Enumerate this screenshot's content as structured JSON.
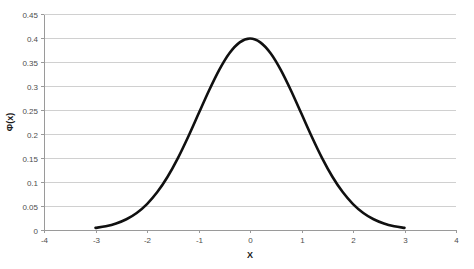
{
  "chart_data": {
    "type": "line",
    "title": "",
    "subtitle": "",
    "xlabel": "X",
    "ylabel": "Φ(x)",
    "xlim": [
      -4,
      4
    ],
    "ylim": [
      0,
      0.45
    ],
    "grid": "horizontal",
    "legend": "none",
    "x_ticks": [
      "-4",
      "-3",
      "-2",
      "-1",
      "0",
      "1",
      "2",
      "3",
      "4"
    ],
    "x_tick_values": [
      -4,
      -3,
      -2,
      -1,
      0,
      1,
      2,
      3,
      4
    ],
    "y_ticks": [
      "0",
      "0.05",
      "0.1",
      "0.15",
      "0.2",
      "0.25",
      "0.3",
      "0.35",
      "0.4",
      "0.45"
    ],
    "y_tick_values": [
      0,
      0.05,
      0.1,
      0.15,
      0.2,
      0.25,
      0.3,
      0.35,
      0.4,
      0.45
    ],
    "series": [
      {
        "name": "standard-normal-pdf",
        "color": "#101010",
        "x": [
          -3.0,
          -2.8,
          -2.6,
          -2.4,
          -2.2,
          -2.0,
          -1.8,
          -1.6,
          -1.4,
          -1.2,
          -1.0,
          -0.8,
          -0.6,
          -0.4,
          -0.2,
          0.0,
          0.2,
          0.4,
          0.6,
          0.8,
          1.0,
          1.2,
          1.4,
          1.6,
          1.8,
          2.0,
          2.2,
          2.4,
          2.6,
          2.8,
          3.0
        ],
        "values": [
          0.0044,
          0.0079,
          0.0136,
          0.0224,
          0.0355,
          0.054,
          0.079,
          0.1109,
          0.1497,
          0.1942,
          0.242,
          0.2897,
          0.3332,
          0.3683,
          0.391,
          0.3989,
          0.391,
          0.3683,
          0.3332,
          0.2897,
          0.242,
          0.1942,
          0.1497,
          0.1109,
          0.079,
          0.054,
          0.0355,
          0.0224,
          0.0136,
          0.0079,
          0.0044
        ]
      }
    ],
    "peak": {
      "x": 0,
      "y": 0.3989
    }
  },
  "plot": {
    "left": 44,
    "right": 456,
    "top": 14,
    "bottom": 230
  },
  "colors": {
    "curve": "#101010",
    "gridline": "#d0d0d0",
    "axis": "#9a9a9a",
    "tick_label": "#4d4d4d",
    "axis_title": "#1a1a1a",
    "background": "#ffffff"
  }
}
